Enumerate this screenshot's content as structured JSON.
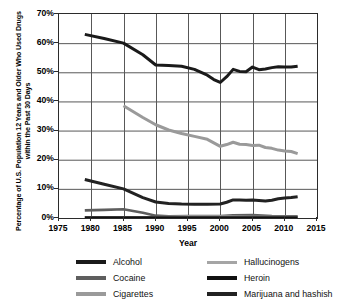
{
  "chart_data": {
    "type": "line",
    "title": "",
    "xlabel": "Year",
    "ylabel": "Percentage of U.S. Population 12 Years and Older Who Used Drugs within the Past 30 Days",
    "xlim": [
      1975,
      2015
    ],
    "ylim": [
      0,
      70
    ],
    "xticks": [
      "1975",
      "1980",
      "1985",
      "1990",
      "1995",
      "2000",
      "2005",
      "2010",
      "2015"
    ],
    "yticks": [
      "0%",
      "10%",
      "20%",
      "30%",
      "40%",
      "50%",
      "60%",
      "70%"
    ],
    "grid": true,
    "legend_position": "bottom",
    "series": [
      {
        "name": "Alcohol",
        "color": "#1a1a1a",
        "width": 3.0,
        "x": [
          1979,
          1982,
          1985,
          1988,
          1990,
          1992,
          1994,
          1996,
          1998,
          1999,
          2000,
          2001,
          2002,
          2003,
          2004,
          2005,
          2006,
          2007,
          2008,
          2009,
          2010,
          2011,
          2012
        ],
        "y": [
          63.0,
          61.6,
          60.0,
          56.0,
          52.5,
          52.3,
          52.1,
          51.0,
          49.0,
          47.5,
          46.5,
          48.5,
          51.0,
          50.3,
          50.2,
          51.8,
          50.9,
          51.1,
          51.6,
          51.9,
          51.8,
          51.8,
          52.1
        ]
      },
      {
        "name": "Cocaine",
        "color": "#5e5e5e",
        "width": 2.6,
        "x": [
          1979,
          1982,
          1985,
          1988,
          1990,
          1992,
          1995,
          2000,
          2002,
          2005,
          2008,
          2010,
          2012
        ],
        "y": [
          2.6,
          2.8,
          3.0,
          1.8,
          0.8,
          0.6,
          0.7,
          0.7,
          0.9,
          1.0,
          0.7,
          0.6,
          0.6
        ]
      },
      {
        "name": "Cigarettes",
        "color": "#9a9a9a",
        "width": 3.0,
        "x": [
          1985,
          1988,
          1990,
          1992,
          1994,
          1996,
          1998,
          1999,
          2000,
          2001,
          2002,
          2003,
          2004,
          2005,
          2006,
          2007,
          2008,
          2009,
          2010,
          2011,
          2012
        ],
        "y": [
          38.5,
          34.5,
          32.0,
          30.2,
          29.0,
          28.0,
          27.0,
          25.8,
          24.6,
          25.2,
          26.0,
          25.3,
          25.2,
          24.9,
          25.0,
          24.2,
          23.9,
          23.3,
          23.0,
          22.8,
          22.1
        ]
      },
      {
        "name": "Hallucinogens",
        "color": "#a5a5a5",
        "width": 2.4,
        "x": [
          1979,
          1982,
          1985,
          1990,
          1995,
          2000,
          2005,
          2010,
          2012
        ],
        "y": [
          0.3,
          0.3,
          0.3,
          0.3,
          0.5,
          0.5,
          0.4,
          0.4,
          0.4
        ]
      },
      {
        "name": "Heroin",
        "color": "#111111",
        "width": 2.4,
        "x": [
          1979,
          1985,
          1990,
          1995,
          2000,
          2005,
          2010,
          2012
        ],
        "y": [
          0.15,
          0.15,
          0.15,
          0.15,
          0.15,
          0.15,
          0.2,
          0.2
        ]
      },
      {
        "name": "Marijuana and hashish",
        "color": "#222222",
        "width": 3.0,
        "x": [
          1979,
          1982,
          1985,
          1988,
          1990,
          1992,
          1994,
          1996,
          1998,
          2000,
          2001,
          2002,
          2003,
          2004,
          2005,
          2006,
          2007,
          2008,
          2009,
          2010,
          2011,
          2012
        ],
        "y": [
          13.2,
          11.6,
          10.0,
          7.0,
          5.5,
          5.0,
          4.8,
          4.7,
          4.7,
          4.8,
          5.4,
          6.2,
          6.2,
          6.1,
          6.2,
          6.0,
          5.8,
          6.1,
          6.6,
          6.9,
          7.0,
          7.3
        ]
      }
    ]
  },
  "legend": {
    "items": [
      {
        "label": "Alcohol",
        "color": "#1a1a1a",
        "thickness": 4
      },
      {
        "label": "Cocaine",
        "color": "#5e5e5e",
        "thickness": 4
      },
      {
        "label": "Cigarettes",
        "color": "#9a9a9a",
        "thickness": 4
      },
      {
        "label": "Hallucinogens",
        "color": "#a5a5a5",
        "thickness": 3
      },
      {
        "label": "Heroin",
        "color": "#111111",
        "thickness": 4
      },
      {
        "label": "Marijuana and hashish",
        "color": "#222222",
        "thickness": 4
      }
    ]
  }
}
